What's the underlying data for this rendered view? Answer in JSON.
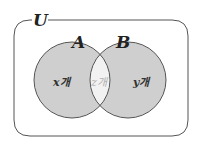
{
  "diagram": {
    "type": "venn",
    "universe": {
      "label": "U"
    },
    "sets": [
      {
        "label": "A",
        "color": "#cfcfcf"
      },
      {
        "label": "B",
        "color": "#cfcfcf"
      }
    ],
    "regions": {
      "a_only": {
        "text": "x개"
      },
      "intersection": {
        "text": "z개",
        "color": "#f2f2f2"
      },
      "b_only": {
        "text": "y개"
      }
    },
    "colors": {
      "stroke": "#555555",
      "set_fill": "#cfcfcf",
      "intersection_fill": "#f2f2f2",
      "background": "#ffffff"
    }
  }
}
